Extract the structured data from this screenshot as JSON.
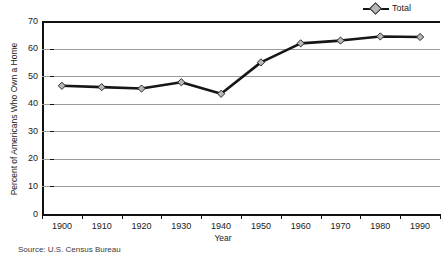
{
  "chart_data": {
    "type": "line",
    "title": "",
    "xlabel": "Year",
    "ylabel": "Percent of Americans Who Own a Home",
    "categories": [
      "1900",
      "1910",
      "1920",
      "1930",
      "1940",
      "1950",
      "1960",
      "1970",
      "1980",
      "1990"
    ],
    "x": [
      1900,
      1910,
      1920,
      1930,
      1940,
      1950,
      1960,
      1970,
      1980,
      1990
    ],
    "series": [
      {
        "name": "Total",
        "values": [
          46.5,
          46,
          45.5,
          47.8,
          43.6,
          55,
          61.9,
          62.9,
          64.4,
          64.2
        ],
        "color": "#161616",
        "marker": "diamond",
        "marker_fill": "#b8b8b8"
      }
    ],
    "ylim": [
      0,
      70
    ],
    "yticks": [
      0,
      10,
      20,
      30,
      40,
      50,
      60,
      70
    ],
    "ytick_labels": [
      "0",
      "10",
      "20",
      "30",
      "40",
      "50",
      "60",
      "70"
    ],
    "grid": true,
    "grid_axis": "y",
    "legend": [
      "Total"
    ],
    "legend_position": "top-right",
    "source_note": "Source: U.S. Census Bureau"
  },
  "legend": {
    "total_label": "Total"
  },
  "axes": {
    "y_title": "Percent of Americans Who Own a Home",
    "x_title": "Year"
  },
  "footer": {
    "source": "Source: U.S. Census Bureau"
  }
}
